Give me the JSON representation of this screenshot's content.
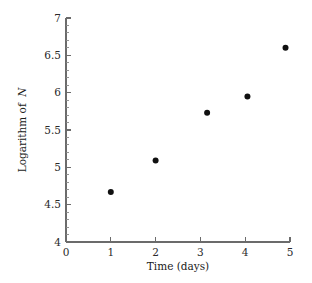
{
  "chart_data": {
    "type": "scatter",
    "title": "",
    "xlabel": "Time (days)",
    "ylabel": "Logarithm of N",
    "ylabel_plain": "Logarithm of",
    "ylabel_italic": "N",
    "xlim": [
      0,
      5
    ],
    "ylim": [
      4,
      7
    ],
    "grid": false,
    "legend": null,
    "x_ticks": [
      0,
      1,
      2,
      3,
      4,
      5
    ],
    "x_ticklabels": [
      "0",
      "1",
      "2",
      "3",
      "4",
      "5"
    ],
    "y_ticks": [
      4,
      4.5,
      5,
      5.5,
      6,
      6.5,
      7
    ],
    "y_ticklabels": [
      "4",
      "4.5",
      "5",
      "5.5",
      "6",
      "6.5",
      "7"
    ],
    "y_minor_tick_step": 0.1,
    "marker": "filled-circle",
    "marker_color": "#101010",
    "marker_size_px": 5,
    "x": [
      1.0,
      2.0,
      3.15,
      4.05,
      4.9
    ],
    "y": [
      4.67,
      5.09,
      5.73,
      5.95,
      6.6
    ],
    "points": [
      {
        "x": 1.0,
        "y": 4.67
      },
      {
        "x": 2.0,
        "y": 5.09
      },
      {
        "x": 3.15,
        "y": 5.73
      },
      {
        "x": 4.05,
        "y": 5.95
      },
      {
        "x": 4.9,
        "y": 6.6
      }
    ]
  },
  "geometry": {
    "plot_left": 66,
    "plot_right": 290,
    "plot_top": 18,
    "plot_bottom": 242
  },
  "colors": {
    "axis": "#6b6b6b",
    "marker": "#101010",
    "text": "#1a1a1a",
    "background": "#ffffff"
  }
}
